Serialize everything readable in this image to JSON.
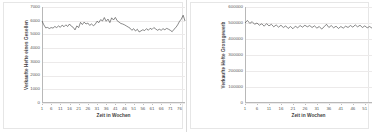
{
  "charts": [
    {
      "id": "left",
      "ytitle": "Verkaufte Hefte eines Gesellen",
      "xtitle": "Zeit in Wochen",
      "yticks": [
        "7000",
        "6000",
        "5000",
        "4000",
        "3000",
        "2000",
        "1000",
        "0"
      ],
      "xticks": [
        "1",
        "6",
        "11",
        "16",
        "21",
        "26",
        "31",
        "36",
        "41",
        "46",
        "51",
        "56",
        "61",
        "66",
        "71",
        "76"
      ]
    },
    {
      "id": "right",
      "ytitle": "Verkaufte Hefte Grossgewerb",
      "xtitle": "Zeit in Wochen",
      "yticks": [
        "600000",
        "500000",
        "400000",
        "300000",
        "200000",
        "100000",
        "0"
      ],
      "xticks": [
        "1",
        "6",
        "11",
        "16",
        "21",
        "26",
        "31",
        "36",
        "41",
        "46",
        "51"
      ]
    }
  ],
  "chart_data": [
    {
      "type": "line",
      "title": "",
      "xlabel": "Zeit in Wochen",
      "ylabel": "Verkaufte Hefte eines Gesellen",
      "xlim": [
        1,
        79
      ],
      "ylim": [
        0,
        7000
      ],
      "ytick_values": [
        0,
        1000,
        2000,
        3000,
        4000,
        5000,
        6000,
        7000
      ],
      "xtick_values": [
        1,
        6,
        11,
        16,
        21,
        26,
        31,
        36,
        41,
        46,
        51,
        56,
        61,
        66,
        71,
        76
      ],
      "grid": true,
      "legend": "none",
      "series": [
        {
          "name": "Verkaufte Hefte eines Gesellen",
          "x": [
            1,
            2,
            3,
            4,
            5,
            6,
            7,
            8,
            9,
            10,
            11,
            12,
            13,
            14,
            15,
            16,
            17,
            18,
            19,
            20,
            21,
            22,
            23,
            24,
            25,
            26,
            27,
            28,
            29,
            30,
            31,
            32,
            33,
            34,
            35,
            36,
            37,
            38,
            39,
            40,
            41,
            42,
            43,
            44,
            45,
            46,
            47,
            48,
            49,
            50,
            51,
            52,
            53,
            54,
            55,
            56,
            57,
            58,
            59,
            60,
            61,
            62,
            63,
            64,
            65,
            66,
            67,
            68,
            69,
            70,
            71,
            72,
            73,
            74,
            75,
            76,
            77,
            78,
            79
          ],
          "values": [
            5980,
            5700,
            5480,
            5510,
            5430,
            5500,
            5460,
            5580,
            5500,
            5620,
            5520,
            5680,
            5560,
            5700,
            5580,
            5760,
            5600,
            5520,
            5330,
            5620,
            5500,
            5880,
            5720,
            5900,
            5760,
            5830,
            5660,
            5760,
            5640,
            5730,
            5960,
            5860,
            6080,
            5980,
            6230,
            5960,
            6120,
            5860,
            6210,
            6050,
            6240,
            6000,
            5900,
            5800,
            5760,
            5700,
            5620,
            5540,
            5460,
            5300,
            5420,
            5250,
            5380,
            5180,
            5260,
            5340,
            5280,
            5420,
            5300,
            5450,
            5360,
            5500,
            5400,
            5300,
            5380,
            5300,
            5420,
            5340,
            5440,
            5380,
            5300,
            5200,
            5380,
            5500,
            5700,
            5950,
            6120,
            6400,
            5980
          ]
        }
      ]
    },
    {
      "type": "line",
      "title": "",
      "xlabel": "Zeit in Wochen",
      "ylabel": "Verkaufte Hefte Grossgewerb",
      "xlim": [
        1,
        54
      ],
      "ylim": [
        0,
        600000
      ],
      "ytick_values": [
        0,
        100000,
        200000,
        300000,
        400000,
        500000,
        600000
      ],
      "xtick_values": [
        1,
        6,
        11,
        16,
        21,
        26,
        31,
        36,
        41,
        46,
        51
      ],
      "grid": true,
      "legend": "none",
      "series": [
        {
          "name": "Verkaufte Hefte Grossgewerb",
          "x": [
            1,
            2,
            3,
            4,
            5,
            6,
            7,
            8,
            9,
            10,
            11,
            12,
            13,
            14,
            15,
            16,
            17,
            18,
            19,
            20,
            21,
            22,
            23,
            24,
            25,
            26,
            27,
            28,
            29,
            30,
            31,
            32,
            33,
            34,
            35,
            36,
            37,
            38,
            39,
            40,
            41,
            42,
            43,
            44,
            45,
            46,
            47,
            48,
            49,
            50,
            51,
            52,
            53,
            54
          ],
          "values": [
            500000,
            516000,
            498000,
            508000,
            492000,
            500000,
            486000,
            495000,
            480000,
            496000,
            482000,
            492000,
            476000,
            488000,
            474000,
            486000,
            472000,
            482000,
            466000,
            478000,
            464000,
            480000,
            470000,
            484000,
            474000,
            486000,
            476000,
            484000,
            472000,
            482000,
            468000,
            478000,
            462000,
            476000,
            492000,
            472000,
            484000,
            470000,
            480000,
            466000,
            478000,
            468000,
            480000,
            472000,
            484000,
            474000,
            488000,
            476000,
            486000,
            472000,
            482000,
            470000,
            478000,
            468000
          ]
        }
      ]
    }
  ]
}
